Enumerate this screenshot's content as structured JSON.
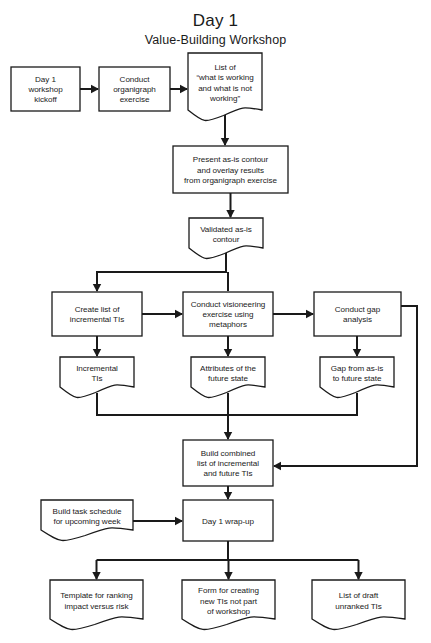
{
  "header": {
    "title": "Day 1",
    "subtitle": "Value-Building Workshop"
  },
  "colors": {
    "stroke": "#1a1a1a",
    "fill": "#ffffff",
    "background": "#ffffff"
  },
  "chart_data": {
    "type": "diagram",
    "diagram_kind": "flowchart",
    "title": "Day 1",
    "subtitle": "Value-Building Workshop",
    "shape_legend": {
      "rectangle": "process / activity",
      "document": "document or deliverable (wavy bottom edge)"
    },
    "nodes": [
      {
        "id": "n1",
        "shape": "rectangle",
        "label": "Day 1\nworkshop\nkickoff",
        "lines": [
          "Day 1",
          "workshop",
          "kickoff"
        ],
        "x": 11,
        "y": 67,
        "w": 69,
        "h": 44
      },
      {
        "id": "n2",
        "shape": "rectangle",
        "label": "Conduct\norganigraph\nexercise",
        "lines": [
          "Conduct",
          "organigraph",
          "exercise"
        ],
        "x": 99,
        "y": 67,
        "w": 71,
        "h": 44
      },
      {
        "id": "n3",
        "shape": "document",
        "label": "List of\n“what is working\nand what is not\nworking”",
        "lines": [
          "List of",
          "“what is working",
          "and what is not",
          "working”"
        ],
        "x": 188,
        "y": 53,
        "w": 74,
        "h": 68
      },
      {
        "id": "n4",
        "shape": "rectangle",
        "label": "Present as-is contour\nand overlay results\nfrom organigraph exercise",
        "lines": [
          "Present as-is contour",
          "and overlay results",
          "from organigraph exercise"
        ],
        "x": 173,
        "y": 146,
        "w": 115,
        "h": 47
      },
      {
        "id": "n5",
        "shape": "document",
        "label": "Validated as-is\ncontour",
        "lines": [
          "Validated as-is",
          "contour"
        ],
        "x": 189,
        "y": 218,
        "w": 74,
        "h": 41
      },
      {
        "id": "n6",
        "shape": "rectangle",
        "label": "Create list of\nincremental TIs",
        "lines": [
          "Create list of",
          "incremental TIs"
        ],
        "x": 52,
        "y": 292,
        "w": 90,
        "h": 44
      },
      {
        "id": "n7",
        "shape": "rectangle",
        "label": "Conduct visioneering\nexercise using\nmetaphors",
        "lines": [
          "Conduct visioneering",
          "exercise using",
          "metaphors"
        ],
        "x": 183,
        "y": 292,
        "w": 90,
        "h": 44
      },
      {
        "id": "n8",
        "shape": "rectangle",
        "label": "Conduct gap\nanalysis",
        "lines": [
          "Conduct gap",
          "analysis"
        ],
        "x": 314,
        "y": 292,
        "w": 87,
        "h": 44
      },
      {
        "id": "n9",
        "shape": "document",
        "label": "Incremental\nTIs",
        "lines": [
          "Incremental",
          "TIs"
        ],
        "x": 60,
        "y": 357,
        "w": 74,
        "h": 41
      },
      {
        "id": "n10",
        "shape": "document",
        "label": "Attributes of the\nfuture state",
        "lines": [
          "Attributes of the",
          "future state"
        ],
        "x": 191,
        "y": 357,
        "w": 74,
        "h": 41
      },
      {
        "id": "n11",
        "shape": "document",
        "label": "Gap from as-is\nto future state",
        "lines": [
          "Gap from as-is",
          "to future state"
        ],
        "x": 320,
        "y": 357,
        "w": 74,
        "h": 41
      },
      {
        "id": "n12",
        "shape": "rectangle",
        "label": "Build combined\nlist of incremental\nand future TIs",
        "lines": [
          "Build combined",
          "list of incremental",
          "and future TIs"
        ],
        "x": 183,
        "y": 440,
        "w": 90,
        "h": 46
      },
      {
        "id": "n13",
        "shape": "document",
        "label": "Build task schedule\nfor upcoming week",
        "lines": [
          "Build task schedule",
          "for upcoming week"
        ],
        "x": 41,
        "y": 500,
        "w": 92,
        "h": 41
      },
      {
        "id": "n14",
        "shape": "rectangle",
        "label": "Day 1 wrap-up",
        "lines": [
          "Day 1 wrap-up"
        ],
        "x": 183,
        "y": 500,
        "w": 90,
        "h": 41
      },
      {
        "id": "n15",
        "shape": "document",
        "label": "Template for ranking\nimpact versus risk",
        "lines": [
          "Template for ranking",
          "impact versus risk"
        ],
        "x": 50,
        "y": 580,
        "w": 93,
        "h": 50
      },
      {
        "id": "n16",
        "shape": "document",
        "label": "Form for creating\nnew TIs not part\nof workshop",
        "lines": [
          "Form for creating",
          "new TIs not part",
          "of workshop"
        ],
        "x": 182,
        "y": 580,
        "w": 93,
        "h": 50
      },
      {
        "id": "n17",
        "shape": "document",
        "label": "List of draft\nunranked TIs",
        "lines": [
          "List of draft",
          "unranked TIs"
        ],
        "x": 312,
        "y": 580,
        "w": 93,
        "h": 50
      }
    ],
    "edges": [
      {
        "from": "n1",
        "to": "n2",
        "kind": "horizontal-arrow"
      },
      {
        "from": "n2",
        "to": "n3",
        "kind": "horizontal-arrow"
      },
      {
        "from": "n3",
        "to": "n4",
        "kind": "vertical-arrow"
      },
      {
        "from": "n4",
        "to": "n5",
        "kind": "vertical-arrow"
      },
      {
        "from": "n5",
        "to": "n6",
        "kind": "elbow-left-down-arrow"
      },
      {
        "from": "n5",
        "to": "n7",
        "kind": "vertical-arrow"
      },
      {
        "from": "n6",
        "to": "n7",
        "kind": "horizontal-arrow"
      },
      {
        "from": "n7",
        "to": "n8",
        "kind": "horizontal-arrow"
      },
      {
        "from": "n6",
        "to": "n9",
        "kind": "vertical-arrow"
      },
      {
        "from": "n7",
        "to": "n10",
        "kind": "vertical-arrow"
      },
      {
        "from": "n8",
        "to": "n11",
        "kind": "vertical-arrow"
      },
      {
        "from": "n9",
        "to": "n12",
        "kind": "merge-bus-down-arrow"
      },
      {
        "from": "n10",
        "to": "n12",
        "kind": "merge-bus-down-arrow"
      },
      {
        "from": "n11",
        "to": "n12",
        "kind": "merge-bus-down-arrow"
      },
      {
        "from": "n8",
        "to": "n12",
        "kind": "right-loop-arrow"
      },
      {
        "from": "n12",
        "to": "n14",
        "kind": "vertical-arrow"
      },
      {
        "from": "n13",
        "to": "n14",
        "kind": "horizontal-arrow"
      },
      {
        "from": "n14",
        "to": "n15",
        "kind": "split-bus-down-arrow"
      },
      {
        "from": "n14",
        "to": "n16",
        "kind": "split-bus-down-arrow"
      },
      {
        "from": "n14",
        "to": "n17",
        "kind": "split-bus-down-arrow"
      }
    ]
  }
}
